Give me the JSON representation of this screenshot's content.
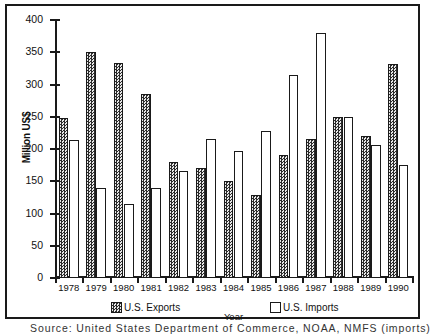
{
  "chart_data": {
    "type": "bar",
    "title": "",
    "xlabel": "Year",
    "ylabel": "Million US$",
    "ylim": [
      0,
      400
    ],
    "yticks": [
      0,
      50,
      100,
      150,
      200,
      250,
      300,
      350,
      400
    ],
    "grid": false,
    "legend_position": "bottom",
    "categories": [
      "1978",
      "1979",
      "1980",
      "1981",
      "1982",
      "1983",
      "1984",
      "1985",
      "1986",
      "1987",
      "1988",
      "1989",
      "1990"
    ],
    "series": [
      {
        "name": "U.S. Exports",
        "style": "hatched-dark",
        "values": [
          248,
          350,
          333,
          286,
          180,
          170,
          150,
          128,
          190,
          216,
          250,
          220,
          332
        ]
      },
      {
        "name": "U.S. Imports",
        "style": "white-outline",
        "values": [
          214,
          139,
          114,
          140,
          166,
          215,
          197,
          228,
          315,
          380,
          249,
          207,
          175
        ]
      }
    ]
  },
  "legend": {
    "entries": [
      {
        "label": "U.S. Exports"
      },
      {
        "label": "U.S. Imports"
      }
    ]
  },
  "caption": {
    "text": "Source: United States Department of Commerce, NOAA, NMFS (imports), USDA"
  },
  "colors": {
    "axis": "#1a1a1a",
    "exports_fill": "#6a6a6a",
    "imports_fill": "#ffffff",
    "text": "#111111"
  }
}
